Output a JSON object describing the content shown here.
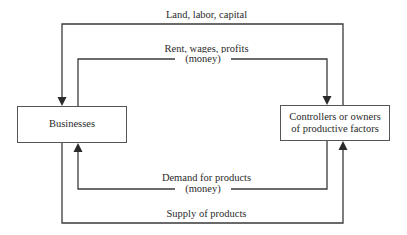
{
  "diagram": {
    "type": "circular-flow",
    "nodes": {
      "businesses": {
        "label": "Businesses"
      },
      "owners": {
        "label_line1": "Controllers or owners",
        "label_line2": "of productive factors"
      }
    },
    "flows": {
      "land_labor_capital": {
        "label": "Land, labor, capital",
        "from": "owners",
        "to": "businesses"
      },
      "rent_wages_profits": {
        "label": "Rent, wages, profits",
        "sublabel": "(money)",
        "from": "businesses",
        "to": "owners"
      },
      "demand_for_products": {
        "label": "Demand for products",
        "sublabel": "(money)",
        "from": "owners",
        "to": "businesses"
      },
      "supply_of_products": {
        "label": "Supply of products",
        "from": "businesses",
        "to": "owners"
      }
    },
    "colors": {
      "line": "#3a3a3a",
      "text": "#2a2a2a",
      "box_border": "#555555"
    }
  }
}
